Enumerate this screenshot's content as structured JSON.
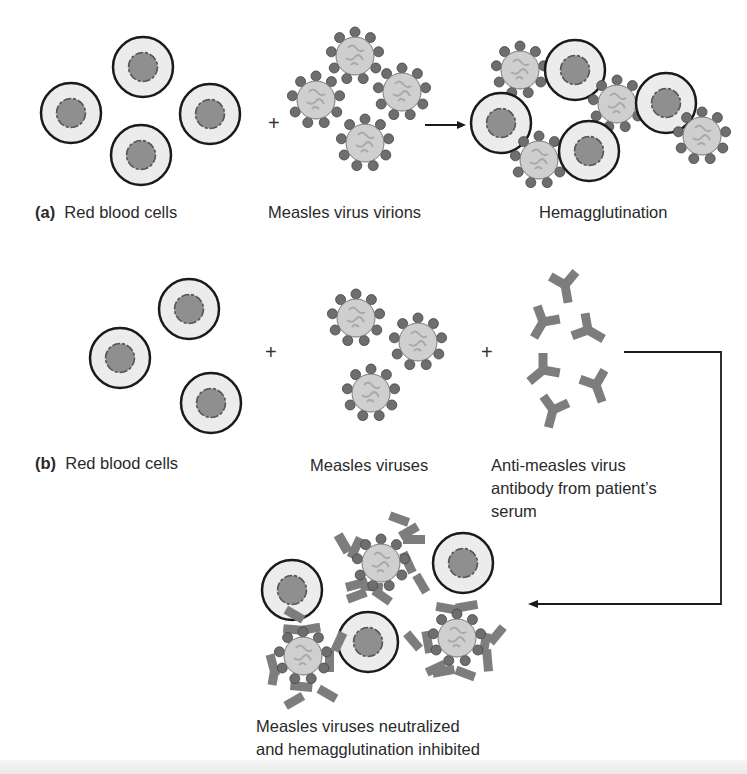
{
  "figure": {
    "panel_a": {
      "tag": "(a)",
      "rbc_label": "Red blood cells",
      "virion_label": "Measles virus virions",
      "result_label": "Hemagglutination",
      "operator": "+"
    },
    "panel_b": {
      "tag": "(b)",
      "rbc_label": "Red blood cells",
      "virus_label": "Measles viruses",
      "antibody_label_line1": "Anti-measles virus",
      "antibody_label_line2": "antibody from patient’s",
      "antibody_label_line3": "serum",
      "operator1": "+",
      "operator2": "+",
      "result_line1": "Measles viruses neutralized",
      "result_line2": "and hemagglutination inhibited"
    },
    "colors": {
      "rbc_fill": "#ececec",
      "rbc_outline": "#1a1a1a",
      "rbc_nucleus": "#8f8f8f",
      "virion_fill": "#cfcfcf",
      "virion_spike": "#6e6e6e",
      "antibody": "#7d7d7d",
      "arrow": "#1a1a1a"
    }
  }
}
